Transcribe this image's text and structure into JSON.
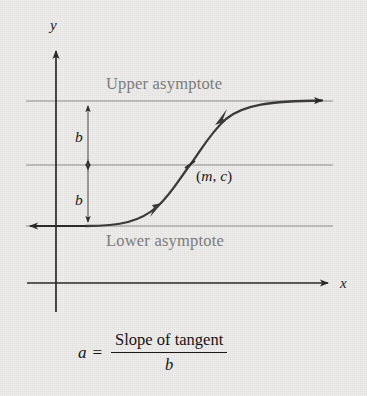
{
  "figure": {
    "type": "diagram",
    "background_color": "#eeedeb",
    "axes": {
      "x_label": "x",
      "y_label": "y",
      "axis_color": "#2a2a2a"
    },
    "annotations": {
      "upper_asymptote": "Upper asymptote",
      "lower_asymptote": "Lower asymptote",
      "b_upper": "b",
      "b_lower": "b",
      "inflection_point": "(m, c)",
      "inflection_point_m": "m",
      "inflection_point_c": "c"
    },
    "formula": {
      "lhs": "a",
      "equals": "=",
      "numerator": "Slope of tangent",
      "denominator": "b"
    },
    "colors": {
      "curve": "#3a3a3a",
      "asymptote_line": "#8c8c8c",
      "asymptote_text": "#7b7b7b",
      "axis": "#2a2a2a",
      "formula_text": "#141414"
    },
    "geometry": {
      "upper_asymptote_y": 101,
      "midline_y": 165,
      "lower_asymptote_y": 226,
      "x_axis_y": 283,
      "y_axis_x": 56,
      "inflection_x": 190,
      "measure_arrow_x": 88
    }
  },
  "chart_data": {
    "type": "line",
    "title": "",
    "xlabel": "x",
    "ylabel": "y",
    "grid": false,
    "legend": "none",
    "series": [
      {
        "name": "logistic curve",
        "x": [
          26,
          60,
          90,
          110,
          130,
          150,
          165,
          178,
          190,
          202,
          214,
          226,
          240,
          260,
          285,
          310,
          330
        ],
        "y": [
          226,
          226,
          225,
          223,
          219,
          212,
          203,
          188,
          165,
          143,
          126,
          116,
          109,
          104,
          101.5,
          101,
          100.5
        ]
      }
    ],
    "reference_lines": [
      {
        "name": "Upper asymptote",
        "orientation": "horizontal",
        "y": 101
      },
      {
        "name": "Midline c",
        "orientation": "horizontal",
        "y": 165
      },
      {
        "name": "Lower asymptote",
        "orientation": "horizontal",
        "y": 226
      }
    ],
    "markers": [
      {
        "label": "(m, c)",
        "x": 190,
        "y": 165
      }
    ],
    "measures": [
      {
        "label": "b",
        "from_y": 101,
        "to_y": 165,
        "at_x": 88
      },
      {
        "label": "b",
        "from_y": 165,
        "to_y": 226,
        "at_x": 88
      }
    ]
  }
}
